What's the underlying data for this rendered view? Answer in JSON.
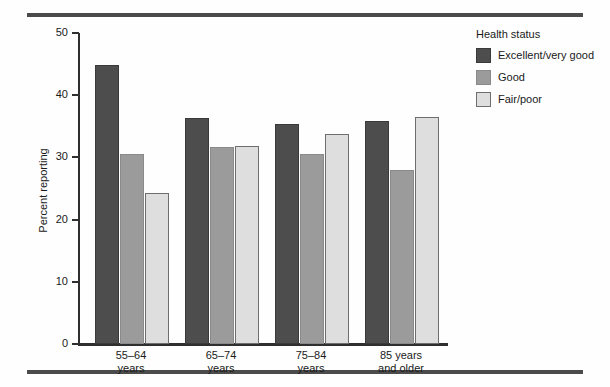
{
  "chart_data": {
    "type": "bar",
    "title": "",
    "xlabel": "",
    "ylabel": "Percent reporting",
    "ylim": [
      0,
      50
    ],
    "yticks": [
      0,
      10,
      20,
      30,
      40,
      50
    ],
    "grid": false,
    "legend_position": "top-right",
    "legend_title": "Health status",
    "categories": [
      "55–64\nyears",
      "65–74\nyears",
      "75–84\nyears",
      "85 years\nand older"
    ],
    "category_lines": [
      [
        "55–64",
        "years"
      ],
      [
        "65–74",
        "years"
      ],
      [
        "75–84",
        "years"
      ],
      [
        "85 years",
        "and older"
      ]
    ],
    "series": [
      {
        "name": "Excellent/very good",
        "color": "#4d4d4d",
        "values": [
          44.9,
          36.4,
          35.3,
          35.8
        ]
      },
      {
        "name": "Good",
        "color": "#9b9b9b",
        "values": [
          30.5,
          31.7,
          30.6,
          27.9
        ]
      },
      {
        "name": "Fair/poor",
        "color": "#dedede",
        "values": [
          24.3,
          31.8,
          33.8,
          36.5
        ]
      }
    ]
  },
  "axis": {
    "y_title": "Percent reporting",
    "tick_labels": [
      "50",
      "40",
      "30",
      "20",
      "10",
      "0"
    ]
  },
  "legend": {
    "title": "Health status",
    "items": [
      {
        "label": "Excellent/very good",
        "color": "#4d4d4d"
      },
      {
        "label": "Good",
        "color": "#9b9b9b"
      },
      {
        "label": "Fair/poor",
        "color": "#dedede"
      }
    ]
  },
  "colors": {
    "rule": "#4b4b4b",
    "axis": "#2f2f2f",
    "background": "#fefefe",
    "series_dark": "#4d4d4d",
    "series_mid": "#9b9b9b",
    "series_light": "#dedede"
  }
}
